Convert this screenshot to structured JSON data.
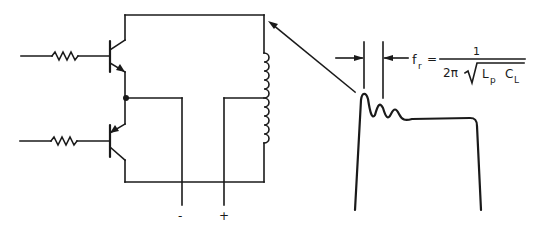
{
  "diagram": {
    "terminals": {
      "negative_label": "-",
      "positive_label": "+"
    },
    "formula": {
      "lhs_main": "f",
      "lhs_sub": "r",
      "equals": "=",
      "numerator": "1",
      "denominator_prefix": "2π",
      "radicand_L": "L",
      "radicand_L_sub": "p",
      "radicand_C": "C",
      "radicand_C_sub": "L"
    },
    "components": [
      {
        "id": "R1",
        "type": "resistor",
        "role": "base resistor upper"
      },
      {
        "id": "R2",
        "type": "resistor",
        "role": "base resistor lower"
      },
      {
        "id": "Q1",
        "type": "npn-transistor",
        "role": "upper switch"
      },
      {
        "id": "Q2",
        "type": "pnp-transistor",
        "role": "lower switch"
      },
      {
        "id": "T1",
        "type": "center-tapped-inductor",
        "role": "primary winding"
      }
    ],
    "colors": {
      "ink": "#1a1a1a",
      "background": "#ffffff"
    }
  }
}
